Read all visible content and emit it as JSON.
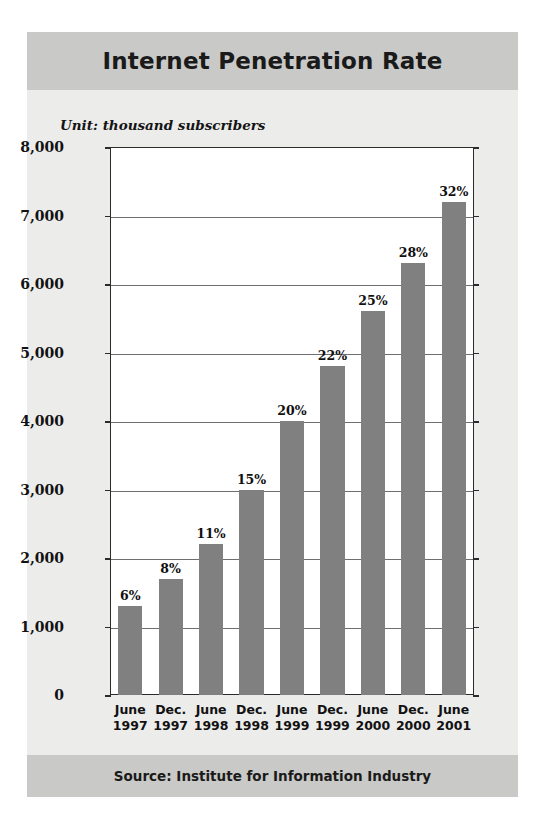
{
  "figure": {
    "title": "Internet Penetration Rate",
    "unit_caption": "Unit: thousand subscribers",
    "source": "Source: Institute for Information Industry",
    "colors": {
      "banner": "#c9c9c7",
      "panel": "#ececeb",
      "bar": "#808080",
      "plot_background": "#ffffff",
      "axis": "#2b2b2b",
      "gridline": "#6f6f6f"
    }
  },
  "chart_data": {
    "type": "bar",
    "title": "Internet Penetration Rate",
    "subtitle": "Unit: thousand subscribers",
    "xlabel": "",
    "ylabel": "Unit: thousand subscribers",
    "ylim": [
      0,
      8000
    ],
    "ytick_step": 1000,
    "grid": true,
    "legend": "none",
    "source": "Source: Institute for Information Industry",
    "ytick_labels": [
      "8,000",
      "7,000",
      "6,000",
      "5,000",
      "4,000",
      "3,000",
      "2,000",
      "1,000",
      "0"
    ],
    "ytick_values": [
      8000,
      7000,
      6000,
      5000,
      4000,
      3000,
      2000,
      1000,
      0
    ],
    "categories": [
      "June 1997",
      "Dec. 1997",
      "June 1998",
      "Dec. 1998",
      "June 1999",
      "Dec. 1999",
      "June 2000",
      "Dec. 2000",
      "June 2001"
    ],
    "category_lines": [
      {
        "month": "June",
        "year": "1997"
      },
      {
        "month": "Dec.",
        "year": "1997"
      },
      {
        "month": "June",
        "year": "1998"
      },
      {
        "month": "Dec.",
        "year": "1998"
      },
      {
        "month": "June",
        "year": "1999"
      },
      {
        "month": "Dec.",
        "year": "1999"
      },
      {
        "month": "June",
        "year": "2000"
      },
      {
        "month": "Dec.",
        "year": "2000"
      },
      {
        "month": "June",
        "year": "2001"
      }
    ],
    "values": [
      1300,
      1700,
      2200,
      3000,
      4000,
      4800,
      5600,
      6300,
      7200
    ],
    "data_labels": [
      "6%",
      "8%",
      "11%",
      "15%",
      "20%",
      "22%",
      "25%",
      "28%",
      "32%"
    ],
    "penetration_rates": [
      6,
      8,
      11,
      15,
      20,
      22,
      25,
      28,
      32
    ]
  }
}
